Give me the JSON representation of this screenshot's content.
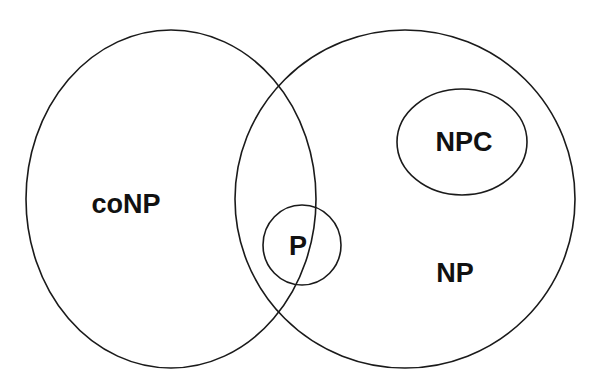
{
  "diagram": {
    "type": "venn",
    "title": "",
    "sets": [
      {
        "id": "conp",
        "label": "coNP",
        "shape": "circle",
        "cx": 171,
        "cy": 199,
        "rx": 145,
        "ry": 169,
        "label_x": 126,
        "label_y": 213
      },
      {
        "id": "np",
        "label": "NP",
        "shape": "circle",
        "cx": 405,
        "cy": 199,
        "rx": 170,
        "ry": 169,
        "label_x": 455,
        "label_y": 282
      },
      {
        "id": "npc",
        "label": "NPC",
        "shape": "ellipse",
        "cx": 462,
        "cy": 142,
        "rx": 65,
        "ry": 53,
        "label_x": 464,
        "label_y": 151
      },
      {
        "id": "p",
        "label": "P",
        "shape": "circle",
        "cx": 302,
        "cy": 245,
        "rx": 39,
        "ry": 40,
        "label_x": 298,
        "label_y": 255
      }
    ],
    "relations": [
      "P is contained in the intersection of coNP and NP",
      "NPC is contained in NP, outside coNP"
    ],
    "stroke_color": "#1a1a1a",
    "background": "#ffffff"
  }
}
